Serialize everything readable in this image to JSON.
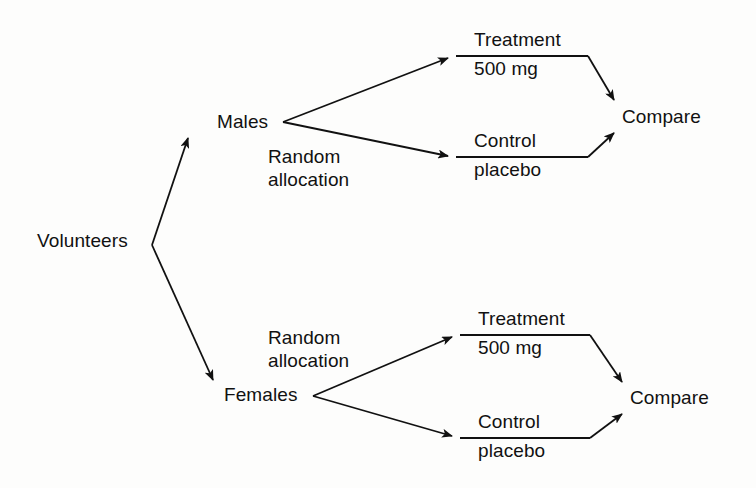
{
  "diagram": {
    "background_color": "#fdfdfc",
    "line_color": "#111111",
    "text_color": "#111111",
    "nodes": {
      "root": "Volunteers",
      "male_branch": {
        "group": "Males",
        "allocation": {
          "line1": "Random",
          "line2": "allocation"
        },
        "treatment": {
          "line1": "Treatment",
          "line2": "500 mg"
        },
        "control": {
          "line1": "Control",
          "line2": "placebo"
        },
        "outcome": "Compare"
      },
      "female_branch": {
        "group": "Females",
        "allocation": {
          "line1": "Random",
          "line2": "allocation"
        },
        "treatment": {
          "line1": "Treatment",
          "line2": "500 mg"
        },
        "control": {
          "line1": "Control",
          "line2": "placebo"
        },
        "outcome": "Compare"
      }
    }
  }
}
